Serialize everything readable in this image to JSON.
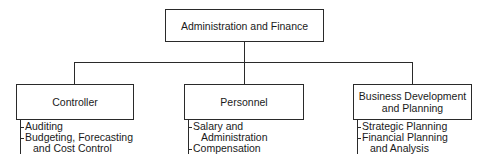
{
  "diagram": {
    "type": "org-chart",
    "root": {
      "label": "Administration and Finance"
    },
    "departments": [
      {
        "label": "Controller",
        "functions": [
          {
            "line1": "Auditing",
            "line2": ""
          },
          {
            "line1": "Budgeting, Forecasting",
            "line2": "and Cost Control"
          }
        ]
      },
      {
        "label": "Personnel",
        "functions": [
          {
            "line1": "Salary and",
            "line2": "Administration"
          },
          {
            "line1": "Compensation",
            "line2": ""
          }
        ]
      },
      {
        "label_line1": "Business Development",
        "label_line2": "and Planning",
        "functions": [
          {
            "line1": "Strategic Planning",
            "line2": ""
          },
          {
            "line1": "Financial Planning",
            "line2": "and Analysis"
          }
        ]
      }
    ]
  }
}
